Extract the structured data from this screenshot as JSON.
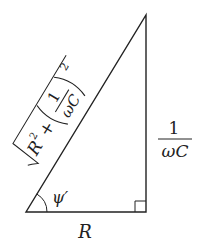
{
  "diagram": {
    "type": "right-triangle impedance diagram",
    "vertices": {
      "bottom_left": [
        26,
        212
      ],
      "bottom_right": [
        146,
        212
      ],
      "top": [
        146,
        15
      ]
    },
    "labels": {
      "base": "R",
      "height_numerator": "1",
      "height_denominator": "ωC",
      "angle": "ψ′",
      "hypotenuse_sqrt_term": "R",
      "hypotenuse_sqrt_exp": "2",
      "hypotenuse_plus": "+",
      "hypotenuse_frac_num": "1",
      "hypotenuse_frac_den": "ωC",
      "hypotenuse_outer_exp": "2",
      "hypotenuse_full": "√(R² + (1/ωC)²)"
    },
    "stroke_color": "#222222",
    "background": "#ffffff"
  }
}
